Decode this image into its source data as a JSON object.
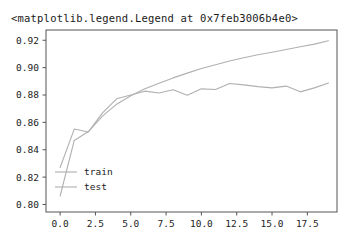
{
  "repr_text": "<matplotlib.legend.Legend at 0x7feb3006b4e0>",
  "chart_data": {
    "type": "line",
    "title": "",
    "xlabel": "",
    "ylabel": "",
    "xlim": [
      -1.0,
      19.6
    ],
    "ylim": [
      0.7945,
      0.9275
    ],
    "grid": false,
    "legend_position": "lower left",
    "xticks": [
      0.0,
      2.5,
      5.0,
      7.5,
      10.0,
      12.5,
      15.0,
      17.5
    ],
    "xtick_labels": [
      "0.0",
      "2.5",
      "5.0",
      "7.5",
      "10.0",
      "12.5",
      "15.0",
      "17.5"
    ],
    "yticks": [
      0.8,
      0.82,
      0.84,
      0.86,
      0.88,
      0.9,
      0.92
    ],
    "ytick_labels": [
      "0.80",
      "0.82",
      "0.84",
      "0.86",
      "0.88",
      "0.90",
      "0.92"
    ],
    "x": [
      0,
      1,
      2,
      3,
      4,
      5,
      6,
      7,
      8,
      9,
      10,
      11,
      12,
      13,
      14,
      15,
      16,
      17,
      18,
      19
    ],
    "series": [
      {
        "name": "train",
        "color": "#b0b0b0",
        "values": [
          0.8062,
          0.8468,
          0.8533,
          0.8646,
          0.8733,
          0.8795,
          0.8846,
          0.8886,
          0.8925,
          0.896,
          0.8993,
          0.9021,
          0.9048,
          0.9072,
          0.9094,
          0.9113,
          0.9133,
          0.9152,
          0.9172,
          0.9196
        ]
      },
      {
        "name": "test",
        "color": "#b0b0b0",
        "values": [
          0.827,
          0.8551,
          0.853,
          0.8669,
          0.8772,
          0.88,
          0.8828,
          0.8815,
          0.8838,
          0.8798,
          0.8845,
          0.884,
          0.8884,
          0.8874,
          0.8861,
          0.8852,
          0.8865,
          0.8823,
          0.8852,
          0.8888
        ]
      }
    ],
    "legend_entries": [
      "train",
      "test"
    ]
  }
}
